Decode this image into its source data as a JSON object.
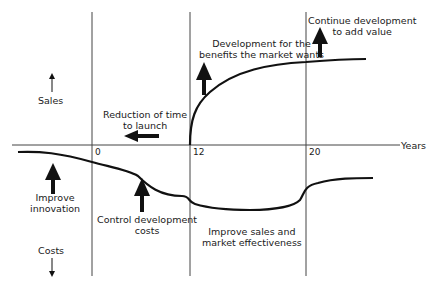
{
  "diagram": {
    "axis": {
      "x_label": "Years",
      "ticks": [
        "0",
        "12",
        "20"
      ]
    },
    "y_top_label": "Sales",
    "y_bottom_label": "Costs",
    "annotations": {
      "reduction": [
        "Reduction of time",
        "to launch"
      ],
      "development": [
        "Development for the",
        "benefits the market wants"
      ],
      "continue": [
        "Continue development",
        "to add value"
      ],
      "innovation": [
        "Improve",
        "innovation"
      ],
      "control": [
        "Control development",
        "costs"
      ],
      "improve_sales": [
        "Improve sales and",
        "market effectiveness"
      ]
    }
  }
}
